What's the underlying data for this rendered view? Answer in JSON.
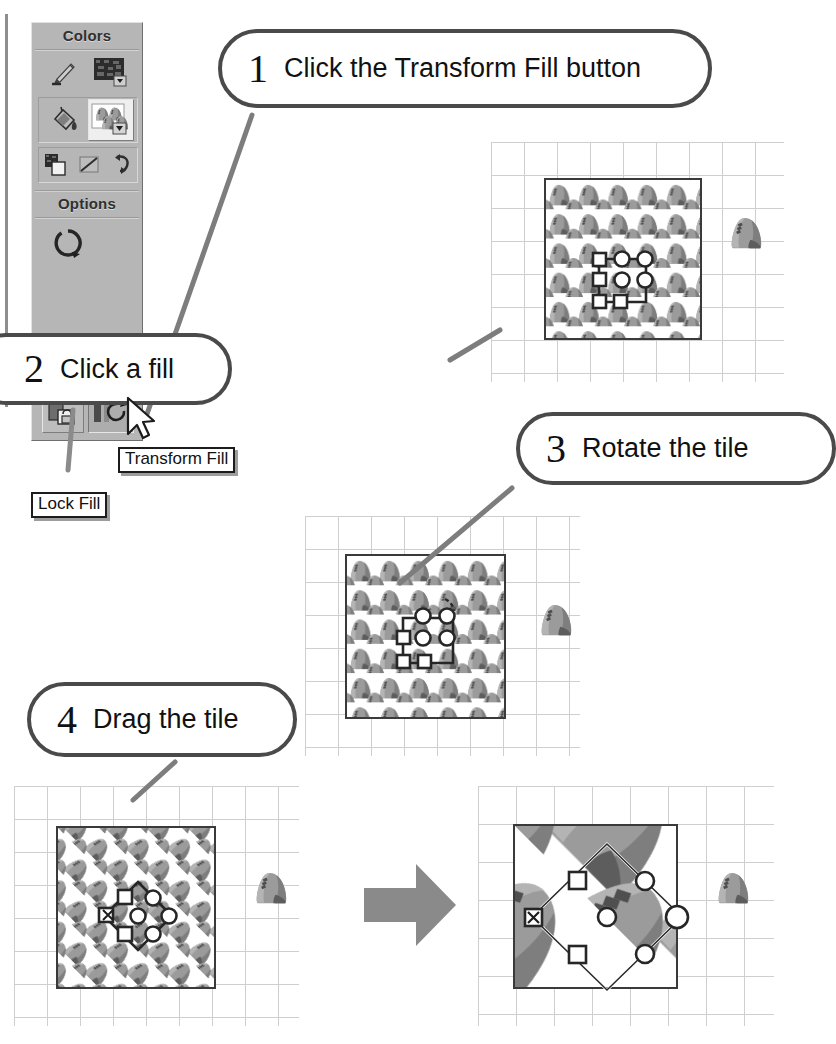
{
  "document": {
    "title": "Transform Fill tutorial",
    "page_width": 797,
    "page_height": 1044,
    "background": "#ffffff",
    "ink_color": "#1a1a1a"
  },
  "tool_panel": {
    "name": "Tools panel",
    "background": "#b6b6b6",
    "sections": [
      {
        "title": "Colors"
      },
      {
        "title": "Options"
      }
    ],
    "colors_title": "Colors",
    "options_title": "Options",
    "buttons": [
      {
        "id": "stroke-color",
        "icon": "pencil-stroke-icon",
        "label": "Stroke Color",
        "state": "normal"
      },
      {
        "id": "fill-color",
        "icon": "fill-color-swatch-icon",
        "label": "Fill Color",
        "state": "normal"
      },
      {
        "id": "paint-bucket",
        "icon": "paint-bucket-icon",
        "label": "Paint Bucket",
        "state": "raised"
      },
      {
        "id": "fill-preview",
        "icon": "bitmap-fill-swatch-icon",
        "label": "Fill Preview",
        "state": "raised"
      },
      {
        "id": "black-white",
        "icon": "black-and-white-icon",
        "label": "Black and White",
        "state": "normal"
      },
      {
        "id": "no-color",
        "icon": "no-color-icon",
        "label": "No Color",
        "state": "normal"
      },
      {
        "id": "swap-colors",
        "icon": "swap-colors-icon",
        "label": "Swap Colors",
        "state": "normal"
      },
      {
        "id": "gap-size",
        "icon": "gap-size-circle-icon",
        "label": "Gap Size",
        "state": "normal"
      },
      {
        "id": "lock-fill",
        "icon": "lock-fill-icon",
        "label": "Lock Fill",
        "state": "normal"
      },
      {
        "id": "transform-fill",
        "icon": "transform-fill-icon",
        "label": "Transform Fill",
        "state": "hovered"
      }
    ]
  },
  "tooltips": [
    {
      "id": "transform-fill-tooltip",
      "text": "Transform Fill"
    },
    {
      "id": "lock-fill-tooltip",
      "text": "Lock Fill"
    }
  ],
  "cursor": {
    "type": "arrow-pointer",
    "x": 133,
    "y": 402
  },
  "steps": [
    {
      "number": "1",
      "text": "Click the Transform Fill button"
    },
    {
      "number": "2",
      "text": "Click a fill"
    },
    {
      "number": "3",
      "text": "Rotate the tile"
    },
    {
      "number": "4",
      "text": "Drag the tile"
    }
  ],
  "canvases": [
    {
      "id": "canvas-step2",
      "caption_step": "2",
      "grid_color": "#cfcfcf",
      "shape_fill": "bitmap-tile-pattern",
      "tile_scale": 1,
      "tile_rotation_deg": 0,
      "loose_tile_present": true,
      "transform_widget": {
        "shape": "square",
        "rotation_deg": 0,
        "handles": 8
      }
    },
    {
      "id": "canvas-step3",
      "caption_step": "3",
      "grid_color": "#cfcfcf",
      "shape_fill": "bitmap-tile-pattern",
      "tile_scale": 1,
      "tile_rotation_deg": 0,
      "loose_tile_present": true,
      "transform_widget": {
        "shape": "square",
        "rotation_deg": 0,
        "handles": 8
      }
    },
    {
      "id": "canvas-step4-before",
      "caption_step": "4",
      "grid_color": "#cfcfcf",
      "shape_fill": "bitmap-tile-pattern",
      "tile_scale": 1,
      "tile_rotation_deg": 45,
      "loose_tile_present": true,
      "transform_widget": {
        "shape": "diamond",
        "rotation_deg": 45,
        "handles": 8
      }
    },
    {
      "id": "canvas-step4-after",
      "caption_step": "4",
      "grid_color": "#cfcfcf",
      "shape_fill": "bitmap-tile-pattern",
      "tile_scale": 4,
      "tile_rotation_deg": 45,
      "loose_tile_present": true,
      "transform_widget": {
        "shape": "diamond",
        "rotation_deg": 45,
        "handles": 8
      }
    }
  ],
  "arrow": {
    "id": "result-arrow",
    "direction": "right",
    "color": "#8a8a8a"
  },
  "colors": {
    "panel_gray": "#b6b6b6",
    "bubble_border": "#4a4a4a",
    "leader_line": "#7d7d7d",
    "grid_line": "#cfcfcf",
    "shape_border": "#3a3a3a",
    "tile_mid": "#9b9b9b",
    "tile_dark": "#6d6d6d",
    "tile_light": "#c6c6c6",
    "arrow_gray": "#8a8a8a"
  }
}
